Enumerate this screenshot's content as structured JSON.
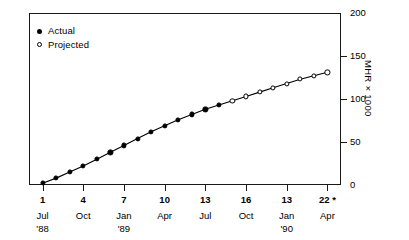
{
  "chart_data": {
    "type": "line",
    "title": "",
    "subtitle": "",
    "xlabel": "",
    "ylabel": "MHR × 1000",
    "ylim": [
      0,
      200
    ],
    "xlim": [
      0,
      23
    ],
    "grid": false,
    "legend_position": "top-left",
    "y_ticks": [
      {
        "value": 200,
        "label": "200"
      },
      {
        "value": 150,
        "label": "150"
      },
      {
        "value": 100,
        "label": "100"
      },
      {
        "value": 50,
        "label": "50"
      },
      {
        "value": 0,
        "label": "0"
      }
    ],
    "x_ticks": [
      {
        "value": 1,
        "num": "1",
        "month": "Jul",
        "year": "'88"
      },
      {
        "value": 4,
        "num": "4",
        "month": "Oct",
        "year": ""
      },
      {
        "value": 7,
        "num": "7",
        "month": "Jan",
        "year": "'89"
      },
      {
        "value": 10,
        "num": "10",
        "month": "Apr",
        "year": ""
      },
      {
        "value": 13,
        "num": "13",
        "month": "Jul",
        "year": ""
      },
      {
        "value": 16,
        "num": "16",
        "month": "Oct",
        "year": ""
      },
      {
        "value": 19,
        "num": "13",
        "month": "Jan",
        "year": "'90"
      },
      {
        "value": 22,
        "num": "22 *",
        "month": "Apr",
        "year": ""
      }
    ],
    "legend": [
      {
        "key": "actual",
        "label": "Actual",
        "marker": "filled-circle"
      },
      {
        "key": "projected",
        "label": "Projected",
        "marker": "open-circle"
      }
    ],
    "series": [
      {
        "name": "Actual",
        "marker": "filled-circle",
        "x": [
          1,
          2,
          3,
          4,
          5,
          6,
          7,
          8,
          9,
          10,
          11,
          12,
          13,
          14
        ],
        "values": [
          2,
          8,
          15,
          22,
          30,
          38,
          46,
          54,
          62,
          69,
          76,
          82,
          88,
          93
        ]
      },
      {
        "name": "Projected",
        "marker": "open-circle",
        "x": [
          15,
          16,
          17,
          18,
          19,
          20,
          21,
          22
        ],
        "values": [
          98,
          103,
          108,
          113,
          118,
          123,
          127,
          131
        ]
      }
    ],
    "footnote": "*"
  }
}
